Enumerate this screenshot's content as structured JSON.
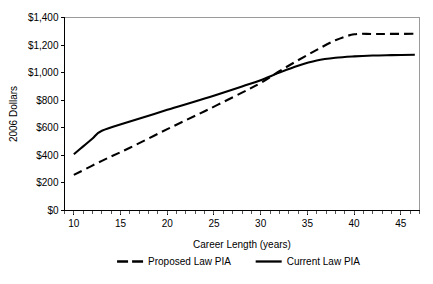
{
  "chart_data": {
    "type": "line",
    "title": "",
    "xlabel": "Career Length (years)",
    "ylabel": "2006 Dollars",
    "xlim": [
      9,
      47
    ],
    "ylim": [
      0,
      1400
    ],
    "grid": false,
    "legend_position": "bottom",
    "x_ticks": [
      10,
      15,
      20,
      25,
      30,
      35,
      40,
      45
    ],
    "x_tick_labels": [
      "10",
      "15",
      "20",
      "25",
      "30",
      "35",
      "40",
      "45"
    ],
    "x_minor_tick_step": 1,
    "y_ticks": [
      0,
      200,
      400,
      600,
      800,
      1000,
      1200,
      1400
    ],
    "y_tick_labels": [
      "$0",
      "$200",
      "$400",
      "$600",
      "$800",
      "$1,000",
      "$1,200",
      "$1,400"
    ],
    "series": [
      {
        "name": "Proposed Law PIA",
        "style": "dashed",
        "color": "#000000",
        "x": [
          10,
          13,
          16,
          20,
          24,
          28,
          30,
          32,
          34,
          36,
          38,
          40,
          42,
          44,
          46.5
        ],
        "values": [
          258,
          360,
          455,
          590,
          720,
          855,
          925,
          1010,
          1090,
          1165,
          1235,
          1278,
          1280,
          1281,
          1282
        ]
      },
      {
        "name": "Current Law PIA",
        "style": "solid",
        "color": "#000000",
        "x": [
          10,
          11,
          12,
          13,
          16,
          20,
          24,
          28,
          30,
          32,
          34,
          36,
          38,
          40,
          42,
          44,
          46.5
        ],
        "values": [
          408,
          465,
          522,
          578,
          645,
          730,
          812,
          900,
          945,
          1000,
          1050,
          1088,
          1108,
          1118,
          1124,
          1127,
          1130
        ]
      }
    ]
  },
  "legend": {
    "items": [
      {
        "label": "Proposed Law PIA",
        "style": "dashed"
      },
      {
        "label": "Current Law PIA",
        "style": "solid"
      }
    ]
  },
  "axis": {
    "x_title": "Career Length (years)",
    "y_title": "2006 Dollars"
  }
}
